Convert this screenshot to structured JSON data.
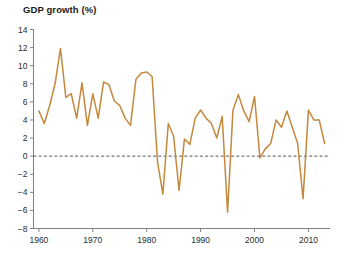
{
  "chart_data": {
    "type": "line",
    "title": "GDP growth (%)",
    "xlabel": "",
    "ylabel": "",
    "grid": false,
    "legend": "none",
    "zero_line": true,
    "zero_line_style": "dashed",
    "line_color": "#c4883c",
    "zero_line_color": "#555555",
    "axis_color": "#808080",
    "xlim": [
      1959,
      2014
    ],
    "ylim": [
      -8,
      14
    ],
    "yticks": [
      -8,
      -6,
      -4,
      -2,
      0,
      2,
      4,
      6,
      8,
      10,
      12,
      14
    ],
    "ytick_labels": [
      "−8",
      "−6",
      "−4",
      "−2",
      "0",
      "2",
      "4",
      "6",
      "8",
      "10",
      "12",
      "14"
    ],
    "xticks": [
      1960,
      1970,
      1980,
      1990,
      2000,
      2010
    ],
    "xtick_labels": [
      "1960",
      "1970",
      "1980",
      "1990",
      "2000",
      "2010"
    ],
    "x": [
      1960,
      1961,
      1962,
      1963,
      1964,
      1965,
      1966,
      1967,
      1968,
      1969,
      1970,
      1971,
      1972,
      1973,
      1974,
      1975,
      1976,
      1977,
      1978,
      1979,
      1980,
      1981,
      1982,
      1983,
      1984,
      1985,
      1986,
      1987,
      1988,
      1989,
      1990,
      1991,
      1992,
      1993,
      1994,
      1995,
      1996,
      1997,
      1998,
      1999,
      2000,
      2001,
      2002,
      2003,
      2004,
      2005,
      2006,
      2007,
      2008,
      2009,
      2010,
      2011,
      2012,
      2013
    ],
    "values": [
      5.0,
      3.6,
      5.6,
      8.0,
      11.9,
      6.5,
      6.9,
      4.2,
      8.1,
      3.4,
      6.9,
      4.2,
      8.2,
      7.9,
      6.1,
      5.6,
      4.2,
      3.4,
      8.5,
      9.2,
      9.3,
      8.8,
      -0.6,
      -4.2,
      3.6,
      2.2,
      -3.8,
      1.9,
      1.3,
      4.2,
      5.1,
      4.2,
      3.6,
      2.0,
      4.4,
      -6.2,
      5.1,
      6.8,
      5.0,
      3.8,
      6.6,
      -0.2,
      0.8,
      1.4,
      4.0,
      3.2,
      5.0,
      3.2,
      1.4,
      -4.7,
      5.1,
      4.0,
      4.0,
      1.4
    ],
    "notable_peaks": [
      {
        "year": 1964,
        "value": 11.9
      },
      {
        "year": 1980,
        "value": 9.3
      },
      {
        "year": 1978,
        "value": 8.5
      }
    ],
    "notable_troughs": [
      {
        "year": 1983,
        "value": -4.2
      },
      {
        "year": 1986,
        "value": -3.8
      },
      {
        "year": 1995,
        "value": -6.2
      },
      {
        "year": 2009,
        "value": -4.7
      }
    ]
  }
}
